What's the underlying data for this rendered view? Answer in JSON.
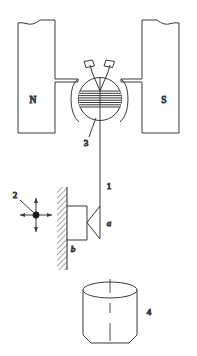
{
  "figure": {
    "stroke_color": "#3a3a3a",
    "hatch_color": "#555555",
    "text_color": "#1a1a1a",
    "background_color": "#ffffff",
    "width": 197,
    "height": 356
  },
  "labels": {
    "pole_north": "N",
    "pole_south": "S",
    "suspension_wire": "1",
    "force_cross": "2",
    "coil_core": "3",
    "vessel": "4",
    "knife_edge": "a",
    "bracket_wall": "b"
  },
  "parts": [
    {
      "id": "1",
      "name": "suspension-wire"
    },
    {
      "id": "2",
      "name": "force-direction-cross"
    },
    {
      "id": "3",
      "name": "coil-core"
    },
    {
      "id": "4",
      "name": "cylindrical-vessel"
    },
    {
      "id": "a",
      "name": "knife-edge-wedge"
    },
    {
      "id": "b",
      "name": "wall-bracket"
    }
  ],
  "magnet": {
    "north_label": "N",
    "south_label": "S"
  },
  "coil": {
    "vane_count": 2,
    "winding_line_count": 7
  }
}
